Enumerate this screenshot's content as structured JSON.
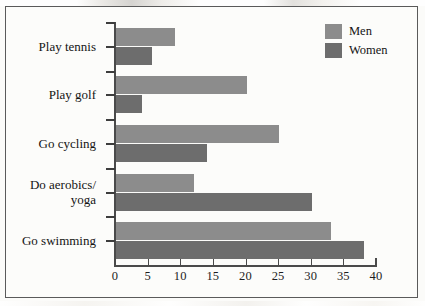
{
  "chart_data": {
    "type": "bar",
    "orientation": "horizontal",
    "title": "",
    "xlabel": "",
    "ylabel": "",
    "xlim": [
      0,
      40
    ],
    "xticks": [
      "0",
      "5",
      "10",
      "15",
      "20",
      "25",
      "30",
      "35",
      "40"
    ],
    "grid": false,
    "legend_position": "top-right",
    "categories": [
      "Play tennis",
      "Play golf",
      "Go cycling",
      "Do aerobics/\nyoga",
      "Go swimming"
    ],
    "series": [
      {
        "name": "Men",
        "color": "#8c8c8c",
        "values": [
          9,
          20,
          25,
          12,
          33
        ]
      },
      {
        "name": "Women",
        "color": "#6d6d6d",
        "values": [
          5.5,
          4,
          14,
          30,
          38
        ]
      }
    ]
  },
  "legend": {
    "entries": [
      {
        "label": "Men",
        "swatch": "men-swatch"
      },
      {
        "label": "Women",
        "swatch": "women-swatch"
      }
    ]
  }
}
